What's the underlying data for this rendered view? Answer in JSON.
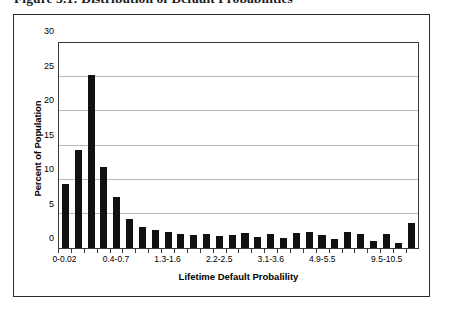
{
  "figure": {
    "caption": "Figure 3.1: Distribution of Default Probabilities"
  },
  "chart_data": {
    "type": "bar",
    "title": "",
    "xlabel": "Lifetime Default Probalility",
    "ylabel": "Percent of Population",
    "ylim": [
      0,
      30
    ],
    "yticks": [
      0,
      5,
      10,
      15,
      20,
      25,
      30
    ],
    "ytick_labels": [
      "0",
      "5",
      "10",
      "15",
      "20",
      "25",
      "30"
    ],
    "grid": true,
    "legend": false,
    "bar_color": "#111111",
    "grid_color": "#b9b9b9",
    "categories": [
      "0-0.02",
      "0.02-0.1",
      "0.1-0.2",
      "0.2-0.4",
      "0.4-0.7",
      "0.7-0.9",
      "0.9-1.1",
      "1.1-1.3",
      "1.3-1.6",
      "1.6-1.8",
      "1.8-2.0",
      "2.0-2.2",
      "2.2-2.5",
      "2.5-2.7",
      "2.7-2.9",
      "2.9-3.1",
      "3.1-3.6",
      "3.6-4.0",
      "4.0-4.4",
      "4.4-4.9",
      "4.9-5.5",
      "5.5-6.5",
      "6.5-7.5",
      "7.5-8.5",
      "8.5-9.5",
      "9.5-10.5",
      "10.5-12.0",
      "12.0-15.0"
    ],
    "visible_tick_labels": [
      {
        "index": 0,
        "label": "0-0.02"
      },
      {
        "index": 4,
        "label": "0.4-0.7"
      },
      {
        "index": 8,
        "label": "1.3-1.6"
      },
      {
        "index": 12,
        "label": "2.2-2.5"
      },
      {
        "index": 16,
        "label": "3.1-3.6"
      },
      {
        "index": 20,
        "label": "4.9-5.5"
      },
      {
        "index": 25,
        "label": "9.5-10.5"
      }
    ],
    "values": [
      9.4,
      14.4,
      25.3,
      11.8,
      7.4,
      4.2,
      3.1,
      2.7,
      2.4,
      2.0,
      1.9,
      2.1,
      1.7,
      1.9,
      2.2,
      1.6,
      2.0,
      1.4,
      2.2,
      2.4,
      1.9,
      1.3,
      2.3,
      2.1,
      1.0,
      2.1,
      0.8,
      3.7
    ]
  }
}
